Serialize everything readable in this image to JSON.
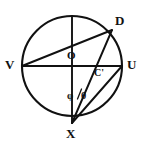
{
  "figure": {
    "kind": "circle-geometry-diagram",
    "background_color": "#ffffff",
    "stroke_color": "#111111",
    "width": 146,
    "height": 150
  },
  "circle": {
    "center_label": "O",
    "center_x": 72,
    "center_y": 66,
    "radius": 50,
    "stroke_width": 2.0
  },
  "points": {
    "center": {
      "label": "O",
      "x": 72,
      "y": 66,
      "label_x": 67,
      "label_y": 52
    },
    "left": {
      "label": "V",
      "x": 22,
      "y": 66,
      "label_x": 6,
      "label_y": 59
    },
    "right": {
      "label": "U",
      "x": 122,
      "y": 66,
      "label_x": 127,
      "label_y": 59
    },
    "bottom": {
      "label": "X",
      "x": 72,
      "y": 123,
      "label_x": 67,
      "label_y": 128
    },
    "upper_right": {
      "label": "D",
      "x": 112,
      "y": 30,
      "label_x": 116,
      "label_y": 15
    },
    "interior": {
      "label": "C'",
      "x": 97,
      "y": 66,
      "label_x": 95,
      "label_y": 68
    }
  },
  "segments": [
    {
      "name": "vertical-diameter",
      "from": "top",
      "to": "X",
      "x1": 72,
      "y1": 16,
      "x2": 72,
      "y2": 123
    },
    {
      "name": "horizontal-diameter-VU",
      "from": "V",
      "to": "U",
      "x1": 22,
      "y1": 66,
      "x2": 122,
      "y2": 66
    },
    {
      "name": "chord-V-D",
      "from": "V",
      "to": "D",
      "x1": 22,
      "y1": 66,
      "x2": 112,
      "y2": 30
    },
    {
      "name": "chord-X-D",
      "from": "X",
      "to": "D",
      "x1": 72,
      "y1": 123,
      "x2": 112,
      "y2": 30
    },
    {
      "name": "chord-X-U",
      "from": "X",
      "to": "U",
      "x1": 72,
      "y1": 123,
      "x2": 122,
      "y2": 66
    }
  ],
  "angles": [
    {
      "name": "phi",
      "symbol": "φ",
      "vertex": "X",
      "label_x": 68,
      "label_y": 92
    },
    {
      "name": "theta",
      "symbol": "θ",
      "vertex": "X",
      "label_x": 80,
      "label_y": 92
    }
  ],
  "angle_divider": {
    "name": "angle-slash",
    "x1": 78,
    "y1": 99,
    "x2": 82,
    "y2": 89
  }
}
